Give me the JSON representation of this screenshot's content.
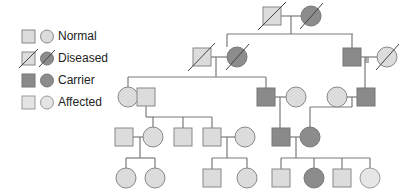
{
  "legend": {
    "items": [
      {
        "label": "Normal",
        "status": "normal"
      },
      {
        "label": "Diseased",
        "status": "diseased"
      },
      {
        "label": "Carrier",
        "status": "carrier"
      },
      {
        "label": "Affected",
        "status": "affected"
      }
    ]
  },
  "colors": {
    "normal_fill": "#dcdcdc",
    "diseased_square_fill": "#dcdcdc",
    "diseased_circle_fill": "#8c8c8c",
    "carrier_fill": "#8a8a8a",
    "affected_fill": "#e4e4e4",
    "stroke": "#777777",
    "line": "#7a7a7a"
  },
  "pedigree": {
    "generations": [
      {
        "id": "I",
        "individuals": [
          {
            "sex": "male",
            "status": "diseased-light"
          },
          {
            "sex": "female",
            "status": "diseased-dark"
          }
        ]
      },
      {
        "id": "II",
        "individuals": [
          {
            "sex": "male",
            "status": "diseased-light"
          },
          {
            "sex": "female",
            "status": "diseased-dark"
          },
          {
            "sex": "male",
            "status": "carrier"
          },
          {
            "sex": "female",
            "status": "diseased-light"
          }
        ]
      },
      {
        "id": "III",
        "individuals": [
          {
            "sex": "female",
            "status": "normal"
          },
          {
            "sex": "male",
            "status": "normal"
          },
          {
            "sex": "male",
            "status": "carrier"
          },
          {
            "sex": "female",
            "status": "normal"
          },
          {
            "sex": "female",
            "status": "normal"
          },
          {
            "sex": "male",
            "status": "carrier"
          }
        ]
      },
      {
        "id": "IV",
        "individuals": [
          {
            "sex": "male",
            "status": "normal"
          },
          {
            "sex": "female",
            "status": "normal"
          },
          {
            "sex": "male",
            "status": "normal"
          },
          {
            "sex": "male",
            "status": "normal"
          },
          {
            "sex": "female",
            "status": "normal"
          },
          {
            "sex": "male",
            "status": "carrier"
          },
          {
            "sex": "female",
            "status": "carrier"
          }
        ]
      },
      {
        "id": "V",
        "individuals": [
          {
            "sex": "female",
            "status": "normal"
          },
          {
            "sex": "female",
            "status": "normal"
          },
          {
            "sex": "male",
            "status": "normal"
          },
          {
            "sex": "female",
            "status": "normal"
          },
          {
            "sex": "male",
            "status": "normal"
          },
          {
            "sex": "female",
            "status": "carrier"
          },
          {
            "sex": "male",
            "status": "normal"
          },
          {
            "sex": "female",
            "status": "affected"
          }
        ]
      }
    ]
  }
}
